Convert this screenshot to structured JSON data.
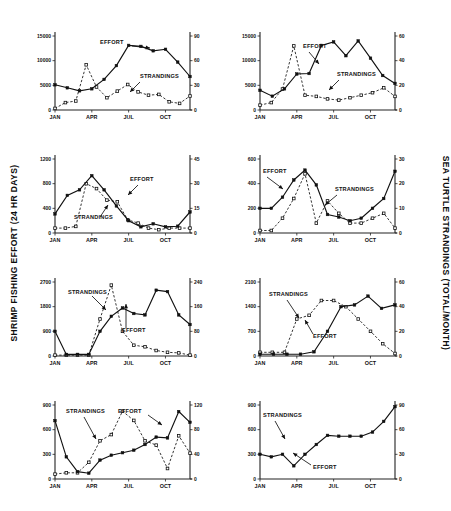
{
  "figure": {
    "ylabel_left": "SHRIMP FISHING EFFORT (24 HR DAYS)",
    "ylabel_right": "SEA TURTLE STRANDINGS (TOTAL/MONTH)",
    "month_ticks": [
      "JAN",
      "APR",
      "JUL",
      "OCT"
    ],
    "series_names": {
      "effort": "EFFORT",
      "strandings": "STRANDINGS"
    }
  },
  "chart_data": [
    {
      "type": "line",
      "title": "TEXAS - 1987",
      "annotation": "r=0.19 p=0.1",
      "xlabel": "",
      "ylabel": "SHRIMP FISHING EFFORT (24 HR DAYS)",
      "y2label": "SEA TURTLE STRANDINGS (TOTAL/MONTH)",
      "x": [
        "JAN",
        "FEB",
        "MAR",
        "APR",
        "MAY",
        "JUN",
        "JUL",
        "AUG",
        "SEP",
        "OCT",
        "NOV",
        "DEC"
      ],
      "ylim": [
        0,
        15000
      ],
      "yticks": [
        0,
        5000,
        10000,
        15000
      ],
      "y2lim": [
        0,
        90
      ],
      "y2ticks": [
        0,
        30,
        60,
        90
      ],
      "grid": false,
      "series": [
        {
          "name": "EFFORT",
          "axis": "left",
          "marker": "filled-square",
          "line": "solid",
          "values": [
            5100,
            4500,
            3900,
            4300,
            6200,
            9000,
            13100,
            12900,
            12000,
            12300,
            9700,
            6800
          ]
        },
        {
          "name": "STRANDINGS",
          "axis": "right",
          "marker": "open-square",
          "line": "dashed",
          "values": [
            2,
            9,
            11,
            55,
            28,
            15,
            23,
            31,
            22,
            18,
            19,
            10,
            8,
            17
          ]
        }
      ]
    },
    {
      "type": "line",
      "title": "TEXAS - 1988",
      "annotation": "r=0.27 p=0.1",
      "x": [
        "JAN",
        "FEB",
        "MAR",
        "APR",
        "MAY",
        "JUN",
        "JUL",
        "AUG",
        "SEP",
        "OCT",
        "NOV",
        "DEC"
      ],
      "ylim": [
        0,
        15000
      ],
      "yticks": [
        0,
        5000,
        10000,
        15000
      ],
      "y2lim": [
        0,
        60
      ],
      "y2ticks": [
        0,
        20,
        40,
        60
      ],
      "grid": false,
      "series": [
        {
          "name": "EFFORT",
          "axis": "left",
          "marker": "filled-square",
          "line": "solid",
          "values": [
            4000,
            2800,
            4300,
            7300,
            7400,
            13100,
            13800,
            11000,
            14000,
            10500,
            7000,
            5400
          ]
        },
        {
          "name": "STRANDINGS",
          "axis": "right",
          "marker": "open-square",
          "line": "dashed",
          "values": [
            4,
            6,
            17,
            52,
            12,
            11,
            9,
            8,
            10,
            12,
            14,
            18,
            11
          ]
        }
      ]
    },
    {
      "type": "line",
      "title": "GULF COAST OF S. FLORIDA-1967",
      "annotation": "r=+0.82 p<0.01",
      "x": [
        "JAN",
        "FEB",
        "MAR",
        "APR",
        "MAY",
        "JUN",
        "JUL",
        "AUG",
        "SEP",
        "OCT",
        "NOV",
        "DEC"
      ],
      "ylim": [
        0,
        1200
      ],
      "yticks": [
        0,
        400,
        800,
        1200
      ],
      "y2lim": [
        0,
        45
      ],
      "y2ticks": [
        0,
        15,
        30,
        45
      ],
      "grid": false,
      "series": [
        {
          "name": "EFFORT",
          "axis": "left",
          "marker": "filled-square",
          "line": "solid",
          "values": [
            310,
            610,
            700,
            930,
            700,
            440,
            200,
            100,
            150,
            100,
            110,
            340
          ]
        },
        {
          "name": "STRANDINGS",
          "axis": "right",
          "marker": "open-square",
          "line": "dashed",
          "values": [
            3,
            3,
            4,
            30,
            27,
            20,
            19,
            8,
            6,
            3,
            2,
            3,
            3,
            3
          ]
        }
      ]
    },
    {
      "type": "line",
      "title": "GULF COAST OF S. FLORIDA-1988",
      "annotation": "r=+0.53 p=0.06",
      "x": [
        "JAN",
        "FEB",
        "MAR",
        "APR",
        "MAY",
        "JUN",
        "JUL",
        "AUG",
        "SEP",
        "OCT",
        "NOV",
        "DEC"
      ],
      "ylim": [
        0,
        600
      ],
      "yticks": [
        0,
        200,
        400,
        600
      ],
      "y2lim": [
        0,
        30
      ],
      "y2ticks": [
        0,
        10,
        20,
        30
      ],
      "grid": false,
      "series": [
        {
          "name": "EFFORT",
          "axis": "left",
          "marker": "filled-square",
          "line": "solid",
          "values": [
            200,
            200,
            290,
            430,
            510,
            390,
            150,
            130,
            100,
            120,
            200,
            280,
            500
          ]
        },
        {
          "name": "STRANDINGS",
          "axis": "right",
          "marker": "open-square",
          "line": "dashed",
          "values": [
            1,
            1,
            6,
            14,
            24,
            4,
            13,
            8,
            4,
            4,
            6,
            8,
            2
          ]
        }
      ]
    },
    {
      "type": "line",
      "title": "GEORGIA-S. CAROLINA - 1987",
      "annotation": "r=+0.23 p=0.1",
      "x": [
        "JAN",
        "FEB",
        "MAR",
        "APR",
        "MAY",
        "JUN",
        "JUL",
        "AUG",
        "SEP",
        "OCT",
        "NOV",
        "DEC"
      ],
      "ylim": [
        0,
        2700
      ],
      "yticks": [
        0,
        900,
        1800,
        2700
      ],
      "y2lim": [
        0,
        240
      ],
      "y2ticks": [
        0,
        80,
        160,
        240
      ],
      "grid": false,
      "series": [
        {
          "name": "EFFORT",
          "axis": "left",
          "marker": "filled-square",
          "line": "solid",
          "values": [
            900,
            60,
            60,
            60,
            900,
            1450,
            1750,
            1550,
            1500,
            2400,
            2350,
            1500,
            1150
          ]
        },
        {
          "name": "STRANDINGS",
          "axis": "right",
          "marker": "open-square",
          "line": "dashed",
          "values": [
            3,
            3,
            3,
            3,
            120,
            230,
            80,
            35,
            30,
            18,
            12,
            10,
            3
          ]
        }
      ]
    },
    {
      "type": "line",
      "title": "GEORGIA-S. CAROLINA - 1988",
      "annotation": "r=+0.28 p=0.1",
      "x": [
        "JAN",
        "FEB",
        "MAR",
        "APR",
        "MAY",
        "JUN",
        "JUL",
        "AUG",
        "SEP",
        "OCT",
        "NOV",
        "DEC"
      ],
      "ylim": [
        0,
        2100
      ],
      "yticks": [
        0,
        700,
        1400,
        2100
      ],
      "y2lim": [
        0,
        60
      ],
      "y2ticks": [
        0,
        20,
        40,
        60
      ],
      "grid": false,
      "series": [
        {
          "name": "EFFORT",
          "axis": "left",
          "marker": "filled-square",
          "line": "solid",
          "values": [
            50,
            50,
            50,
            50,
            120,
            700,
            1400,
            1450,
            1700,
            1350,
            1450
          ]
        },
        {
          "name": "STRANDINGS",
          "axis": "right",
          "marker": "open-square",
          "line": "dashed",
          "values": [
            3,
            3,
            3,
            30,
            33,
            45,
            45,
            40,
            30,
            20,
            10,
            2
          ]
        }
      ]
    },
    {
      "type": "line",
      "title": "ATLANTIC FLORIDA - 1987",
      "annotation": "r=+0.05 p=0.1",
      "x": [
        "JAN",
        "FEB",
        "MAR",
        "APR",
        "MAY",
        "JUN",
        "JUL",
        "AUG",
        "SEP",
        "OCT",
        "NOV",
        "DEC"
      ],
      "ylim": [
        0,
        900
      ],
      "yticks": [
        0,
        300,
        600,
        900
      ],
      "y2lim": [
        0,
        120
      ],
      "y2ticks": [
        0,
        40,
        80,
        120
      ],
      "grid": false,
      "series": [
        {
          "name": "EFFORT",
          "axis": "left",
          "marker": "filled-square",
          "line": "solid",
          "values": [
            710,
            270,
            90,
            70,
            230,
            290,
            320,
            350,
            420,
            510,
            500,
            820,
            690
          ]
        },
        {
          "name": "STRANDINGS",
          "axis": "right",
          "marker": "open-square",
          "line": "dashed",
          "values": [
            8,
            10,
            10,
            27,
            62,
            72,
            110,
            95,
            62,
            55,
            17,
            70,
            42
          ]
        }
      ]
    },
    {
      "type": "line",
      "title": "ATLANTIC FLORIDA - 1988",
      "annotation": "r=+0.58 p=0.05",
      "x": [
        "JAN",
        "FEB",
        "MAR",
        "APR",
        "MAY",
        "JUN",
        "JUL",
        "AUG",
        "SEP",
        "OCT",
        "NOV",
        "DEC"
      ],
      "ylim": [
        0,
        900
      ],
      "yticks": [
        0,
        300,
        600,
        900
      ],
      "y2lim": [
        0,
        90
      ],
      "y2ticks": [
        0,
        30,
        60,
        90
      ],
      "grid": false,
      "series": [
        {
          "name": "EFFORT",
          "axis": "left",
          "marker": "filled-square",
          "line": "solid",
          "values": [
            300,
            270,
            300,
            160,
            300,
            420,
            530,
            520,
            520,
            520,
            570,
            700,
            880
          ]
        },
        {
          "name": "STRANDINGS",
          "axis": "right",
          "marker": "open-square",
          "line": "dashed",
          "values": [
            160,
            260,
            420,
            430,
            440,
            430,
            520,
            530,
            820,
            520,
            540,
            760,
            540
          ]
        }
      ]
    }
  ]
}
